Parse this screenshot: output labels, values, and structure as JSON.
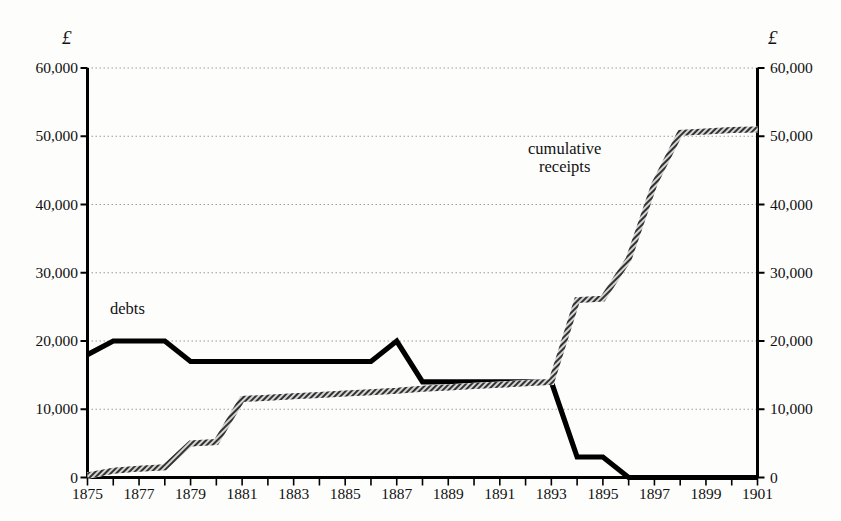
{
  "chart_data": {
    "type": "line",
    "title": "",
    "xlabel": "",
    "ylabel": "",
    "unit_symbol_left": "£",
    "unit_symbol_right": "£",
    "xlim": [
      1875,
      1901
    ],
    "ylim": [
      0,
      60000
    ],
    "grid": true,
    "grid_axis": "y",
    "legend_position": "inline-annotations",
    "ytick_labels": [
      "0",
      "10,000",
      "20,000",
      "30,000",
      "40,000",
      "50,000",
      "60,000"
    ],
    "ytick_values": [
      0,
      10000,
      20000,
      30000,
      40000,
      50000,
      60000
    ],
    "xtick_labels": [
      "1875",
      "1877",
      "1879",
      "1881",
      "1883",
      "1885",
      "1887",
      "1889",
      "1891",
      "1893",
      "1895",
      "1897",
      "1899",
      "1901"
    ],
    "xtick_values": [
      1875,
      1877,
      1879,
      1881,
      1883,
      1885,
      1887,
      1889,
      1891,
      1893,
      1895,
      1897,
      1899,
      1901
    ],
    "x": [
      1875,
      1876,
      1877,
      1878,
      1879,
      1880,
      1881,
      1882,
      1883,
      1884,
      1885,
      1886,
      1887,
      1888,
      1889,
      1890,
      1891,
      1892,
      1893,
      1894,
      1895,
      1896,
      1897,
      1898,
      1899,
      1900,
      1901
    ],
    "series": [
      {
        "name": "debts",
        "style": "solid-thick-black",
        "color": "#000000",
        "values": [
          18000,
          20000,
          20000,
          20000,
          17000,
          17000,
          17000,
          17000,
          17000,
          17000,
          17000,
          17000,
          20000,
          14000,
          14000,
          14000,
          14000,
          14000,
          14000,
          3000,
          3000,
          0,
          0,
          0,
          0,
          0,
          0
        ]
      },
      {
        "name": "cumulative receipts",
        "style": "hatched-grey",
        "color": "#6e6e6e",
        "values": [
          300,
          1000,
          1300,
          1500,
          5000,
          5200,
          11500,
          11700,
          11900,
          12100,
          12300,
          12500,
          12700,
          13000,
          13200,
          13400,
          13600,
          13800,
          14000,
          26000,
          26200,
          32000,
          43000,
          50500,
          50700,
          50900,
          51000
        ]
      }
    ],
    "annotations": [
      {
        "name": "debts",
        "text": "debts",
        "x": 1876.5,
        "y": 22500
      },
      {
        "name": "cumulative-receipts",
        "text": "cumulative\nreceipts",
        "x": 1892.2,
        "y": 47000
      }
    ]
  }
}
